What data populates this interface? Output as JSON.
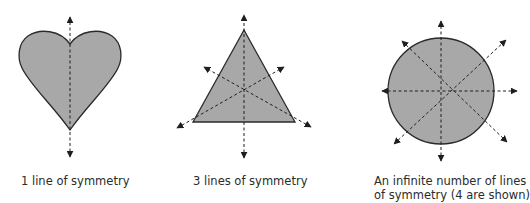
{
  "colors": {
    "fill": "#a8a8a8",
    "stroke": "#2a2a2a",
    "axis": "#1e1e1e",
    "background": "#ffffff"
  },
  "panels": [
    {
      "shape": "heart",
      "lines_shown": 1,
      "caption": "1 line of symmetry"
    },
    {
      "shape": "equilateral-triangle",
      "lines_shown": 3,
      "caption": "3 lines of symmetry"
    },
    {
      "shape": "circle",
      "lines_shown": 4,
      "caption_line1": "An infinite number of lines",
      "caption_line2": "of symmetry (4 are shown)"
    }
  ]
}
